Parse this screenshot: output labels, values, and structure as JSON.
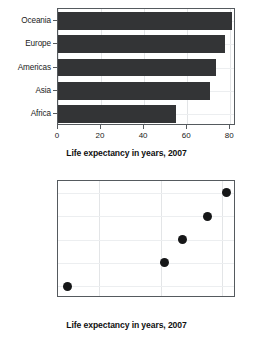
{
  "chart_data": [
    {
      "type": "bar",
      "orientation": "horizontal",
      "title": "",
      "xlabel": "Life expectancy in years, 2007",
      "ylabel": "",
      "categories": [
        "Oceania",
        "Europe",
        "Americas",
        "Asia",
        "Africa"
      ],
      "values": [
        80.7,
        77.6,
        73.6,
        70.7,
        54.8
      ],
      "xlim": [
        0,
        82
      ],
      "xticks": [
        0,
        20,
        40,
        60,
        80
      ],
      "xtick_labels": [
        "0",
        "20",
        "40",
        "60",
        "80"
      ],
      "grid": true,
      "legend": "none",
      "bar_color": "#333436"
    },
    {
      "type": "scatter",
      "orientation": "horizontal",
      "title": "",
      "xlabel": "Life expectancy in years, 2007",
      "ylabel": "",
      "categories": [
        "Oceania",
        "Europe",
        "Americas",
        "Asia",
        "Africa"
      ],
      "values": [
        80.7,
        77.6,
        73.6,
        70.7,
        54.8
      ],
      "xlim": [
        53.3,
        82.2
      ],
      "xticks": [
        60,
        70,
        80
      ],
      "xtick_labels": [
        "60",
        "70",
        "80"
      ],
      "grid": true,
      "legend": "none",
      "point_color": "#161718"
    }
  ],
  "bar_chart": {
    "name": "bar-chart",
    "axis_title": "Life expectancy in years, 2007",
    "categories": [
      {
        "label": "Oceania",
        "value": 80.7
      },
      {
        "label": "Europe",
        "value": 77.6
      },
      {
        "label": "Americas",
        "value": 73.6
      },
      {
        "label": "Asia",
        "value": 70.7
      },
      {
        "label": "Africa",
        "value": 54.8
      }
    ],
    "xticks": [
      {
        "label": "0",
        "value": 0
      },
      {
        "label": "20",
        "value": 20
      },
      {
        "label": "40",
        "value": 40
      },
      {
        "label": "60",
        "value": 60
      },
      {
        "label": "80",
        "value": 80
      }
    ]
  },
  "dot_chart": {
    "name": "dot-chart",
    "axis_title": "Life expectancy in years, 2007",
    "categories": [
      {
        "label": "Oceania",
        "value": 80.7
      },
      {
        "label": "Europe",
        "value": 77.6
      },
      {
        "label": "Americas",
        "value": 73.6
      },
      {
        "label": "Asia",
        "value": 70.7
      },
      {
        "label": "Africa",
        "value": 54.8
      }
    ],
    "xticks": [
      {
        "label": "60",
        "value": 60
      },
      {
        "label": "70",
        "value": 70
      },
      {
        "label": "80",
        "value": 80
      }
    ]
  }
}
